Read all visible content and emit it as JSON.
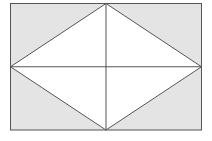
{
  "canvas": {
    "width": 212,
    "height": 141,
    "background_color": "#ffffff"
  },
  "figure": {
    "stroke_color": "#555555",
    "stroke_width": 1,
    "rectangle": {
      "name": "outer-rectangle",
      "fill_color": "#e4e4e4",
      "x": 10.5,
      "y": 3.5,
      "width": 191,
      "height": 126.5,
      "left": 10.5,
      "top": 3.5,
      "right": 201.5,
      "bottom": 130
    },
    "rhombus": {
      "name": "inscribed-rhombus",
      "fill_color": "#ffffff",
      "points": "106,3.5 201.5,66.75 106,130 10.5,66.75",
      "vertices": [
        {
          "label": "top",
          "x": 106,
          "y": 3.5
        },
        {
          "label": "right",
          "x": 201.5,
          "y": 66.75
        },
        {
          "label": "bottom",
          "x": 106,
          "y": 130
        },
        {
          "label": "left",
          "x": 10.5,
          "y": 66.75
        }
      ]
    },
    "diagonals": [
      {
        "name": "horizontal-diagonal",
        "x1": 10.5,
        "y1": 66.75,
        "x2": 201.5,
        "y2": 66.75
      },
      {
        "name": "vertical-diagonal",
        "x1": 106,
        "y1": 3.5,
        "x2": 106,
        "y2": 130
      }
    ],
    "center_point": {
      "x": 106,
      "y": 66.75
    }
  }
}
